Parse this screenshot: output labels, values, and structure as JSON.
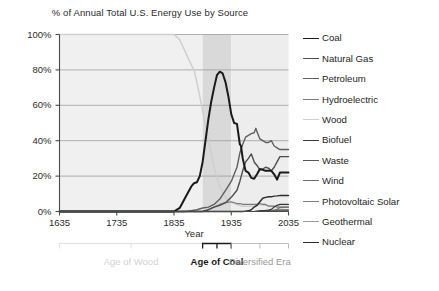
{
  "chart_data": {
    "type": "line",
    "title": "% of Annual Total U.S. Energy Use by Source",
    "xlabel": "Year",
    "ylabel": "",
    "xlim": [
      1635,
      2035
    ],
    "ylim": [
      0,
      100
    ],
    "grid": true,
    "legend_position": "right",
    "xticks": [
      "1635",
      "1735",
      "1835",
      "1935",
      "2035"
    ],
    "xtick_values": [
      1635,
      1735,
      1835,
      1935,
      2035
    ],
    "yticks": [
      "0%",
      "20%",
      "40%",
      "60%",
      "80%",
      "100%"
    ],
    "ytick_values": [
      0,
      20,
      40,
      60,
      80,
      100
    ],
    "annotations": [
      {
        "text": "Age of Wood",
        "start": 1635,
        "end": 1885,
        "style": "light-gray"
      },
      {
        "text": "Age of Coal",
        "start": 1885,
        "end": 1935,
        "style": "black-bold"
      },
      {
        "text": "Diversified Era",
        "start": 1935,
        "end": 2035,
        "style": "gray"
      }
    ],
    "shaded_bands": [
      {
        "start": 1635,
        "end": 1885,
        "color": "#f0f0f0"
      },
      {
        "start": 1885,
        "end": 1935,
        "color": "#d9d9d9"
      },
      {
        "start": 1935,
        "end": 2035,
        "color": "#ededed"
      }
    ],
    "series": [
      {
        "name": "Coal",
        "color": "#1a1a1a",
        "width": 2.0,
        "x": [
          1635,
          1835,
          1845,
          1855,
          1865,
          1870,
          1875,
          1880,
          1885,
          1890,
          1895,
          1900,
          1905,
          1910,
          1915,
          1920,
          1925,
          1930,
          1935,
          1940,
          1945,
          1950,
          1952,
          1955,
          1960,
          1965,
          1970,
          1975,
          1980,
          1985,
          1990,
          1995,
          2000,
          2005,
          2010,
          2015,
          2020,
          2035
        ],
        "y": [
          0,
          0,
          2,
          8,
          14,
          16,
          16.5,
          20,
          28,
          40,
          52,
          62,
          70,
          77,
          79,
          78,
          73,
          65,
          55,
          50,
          49.5,
          38,
          37,
          30,
          23,
          22,
          19,
          18.5,
          21,
          24,
          23.5,
          23,
          23,
          23,
          21,
          18,
          22,
          22
        ]
      },
      {
        "name": "Natural Gas",
        "color": "#4d4d4d",
        "width": 1.4,
        "x": [
          1635,
          1885,
          1895,
          1905,
          1915,
          1925,
          1935,
          1945,
          1950,
          1955,
          1960,
          1965,
          1970,
          1973,
          1975,
          1980,
          1985,
          1990,
          1995,
          2000,
          2005,
          2010,
          2015,
          2020,
          2035
        ],
        "y": [
          0,
          0,
          1,
          2.5,
          3.5,
          5,
          8,
          12,
          17,
          23,
          28,
          30,
          32.5,
          30,
          28,
          26,
          23.5,
          24,
          25,
          24.5,
          23,
          25,
          28,
          31,
          31
        ]
      },
      {
        "name": "Petroleum",
        "color": "#606060",
        "width": 1.4,
        "x": [
          1635,
          1855,
          1865,
          1875,
          1885,
          1895,
          1905,
          1915,
          1925,
          1935,
          1945,
          1950,
          1955,
          1960,
          1965,
          1970,
          1975,
          1978,
          1980,
          1985,
          1990,
          1995,
          2000,
          2005,
          2010,
          2015,
          2020,
          2035
        ],
        "y": [
          0,
          0,
          0.5,
          1,
          2,
          2.5,
          4,
          7,
          12,
          17,
          25,
          33,
          38,
          42,
          43,
          44,
          44.5,
          47,
          45,
          41,
          40,
          39,
          39,
          40,
          37,
          36,
          35,
          35
        ]
      },
      {
        "name": "Hydroelectric",
        "color": "#7a7a7a",
        "width": 1.2,
        "x": [
          1635,
          1885,
          1895,
          1905,
          1915,
          1925,
          1935,
          1945,
          1950,
          1955,
          1960,
          1965,
          1970,
          1975,
          1980,
          1985,
          1990,
          1995,
          2000,
          2005,
          2010,
          2015,
          2020,
          2035
        ],
        "y": [
          0,
          0,
          1,
          2.5,
          4,
          5,
          5.5,
          4.5,
          4.5,
          4,
          4,
          4,
          4,
          4,
          4,
          4.5,
          4,
          4,
          3,
          3,
          3,
          2.5,
          2.5,
          2.5
        ]
      },
      {
        "name": "Wood",
        "color": "#cfcfcf",
        "width": 1.5,
        "x": [
          1635,
          1835,
          1845,
          1855,
          1865,
          1870,
          1875,
          1880,
          1885,
          1890,
          1895,
          1900,
          1905,
          1910,
          1915,
          1920,
          1925,
          1930,
          1935,
          1945,
          1955,
          1965,
          1975,
          1985,
          1995,
          2005,
          2015,
          2035
        ],
        "y": [
          100,
          100,
          97,
          90,
          83,
          80,
          73,
          65,
          57,
          48,
          40,
          33,
          25,
          19,
          14,
          11,
          8,
          6,
          5,
          4,
          3,
          3,
          3,
          4,
          3.5,
          3,
          3,
          3
        ]
      },
      {
        "name": "Biofuel",
        "color": "#3a3a3a",
        "width": 1.2,
        "x": [
          1635,
          1975,
          1985,
          1995,
          2000,
          2005,
          2010,
          2015,
          2020,
          2035
        ],
        "y": [
          0,
          0,
          0.3,
          0.6,
          0.8,
          1.2,
          2.5,
          3.5,
          4,
          4
        ]
      },
      {
        "name": "Waste",
        "color": "#555555",
        "width": 1.1,
        "x": [
          1635,
          1975,
          1985,
          1995,
          2005,
          2015,
          2035
        ],
        "y": [
          0,
          0,
          0.3,
          0.6,
          0.7,
          0.8,
          0.8
        ]
      },
      {
        "name": "Wind",
        "color": "#6e6e6e",
        "width": 1.1,
        "x": [
          1635,
          1985,
          1995,
          2005,
          2010,
          2015,
          2020,
          2035
        ],
        "y": [
          0,
          0,
          0.1,
          0.2,
          0.5,
          1.3,
          2.2,
          2.4
        ]
      },
      {
        "name": "Photovoltaic Solar",
        "color": "#808080",
        "width": 1.1,
        "x": [
          1635,
          1990,
          2000,
          2010,
          2015,
          2020,
          2035
        ],
        "y": [
          0,
          0,
          0.05,
          0.1,
          0.3,
          0.8,
          0.9
        ]
      },
      {
        "name": "Geothermal",
        "color": "#9a9a9a",
        "width": 1.1,
        "x": [
          1635,
          1975,
          1985,
          1995,
          2005,
          2015,
          2035
        ],
        "y": [
          0,
          0,
          0.2,
          0.3,
          0.3,
          0.3,
          0.3
        ]
      },
      {
        "name": "Nuclear",
        "color": "#2b2b2b",
        "width": 1.4,
        "x": [
          1635,
          1955,
          1960,
          1965,
          1970,
          1975,
          1980,
          1985,
          1990,
          1995,
          2000,
          2005,
          2010,
          2015,
          2020,
          2035
        ],
        "y": [
          0,
          0,
          0.2,
          0.4,
          1,
          2.5,
          3.5,
          5.5,
          7.5,
          8,
          8.3,
          8.3,
          8.7,
          8.8,
          9,
          9
        ]
      }
    ]
  },
  "legend": {
    "items": [
      {
        "label": "Coal",
        "color": "#1a1a1a"
      },
      {
        "label": "Natural Gas",
        "color": "#4d4d4d"
      },
      {
        "label": "Petroleum",
        "color": "#606060"
      },
      {
        "label": "Hydroelectric",
        "color": "#7a7a7a"
      },
      {
        "label": "Wood",
        "color": "#cfcfcf"
      },
      {
        "label": "Biofuel",
        "color": "#3a3a3a"
      },
      {
        "label": "Waste",
        "color": "#555555"
      },
      {
        "label": "Wind",
        "color": "#6e6e6e"
      },
      {
        "label": "Photovoltaic Solar",
        "color": "#808080"
      },
      {
        "label": "Geothermal",
        "color": "#9a9a9a"
      },
      {
        "label": "Nuclear",
        "color": "#2b2b2b"
      }
    ]
  }
}
